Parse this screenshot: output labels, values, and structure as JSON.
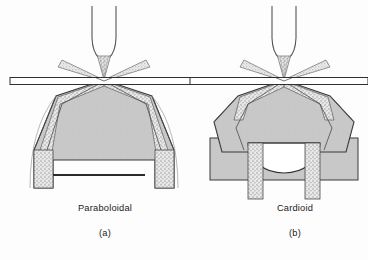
{
  "figure": {
    "background_color": "#fdfdfd",
    "panels": [
      {
        "id": "a",
        "name_label": "Paraboloidal",
        "index_label": "(a)",
        "components": [
          "objective-lens",
          "stippled-light-cone",
          "diverging-ray-wings",
          "glass-slide",
          "condenser-body",
          "stippled-light-path",
          "internal-mirror-stop",
          "condenser-legs"
        ]
      },
      {
        "id": "b",
        "name_label": "Cardioid",
        "index_label": "(b)",
        "components": [
          "objective-lens",
          "stippled-light-cone",
          "diverging-ray-wings",
          "glass-slide",
          "condenser-body",
          "stippled-light-path",
          "cardioid-dome-cavity",
          "condenser-base-block",
          "condenser-legs"
        ]
      }
    ]
  },
  "colors": {
    "body_gray": "#c8c8c8",
    "body_gray_dark": "#bdbdbd",
    "stipple_gray": "#d2d2d2",
    "outline": "#3a3a3a",
    "outline_soft": "#6e6e6e",
    "slide_fill": "#ffffff",
    "text": "#1a1a1a",
    "stop_line": "#2b2b2b"
  },
  "icon_names": {
    "lens": "objective-lens-icon",
    "cone": "light-cone-icon",
    "slide": "glass-slide-icon",
    "dome": "dome-cavity-icon"
  }
}
